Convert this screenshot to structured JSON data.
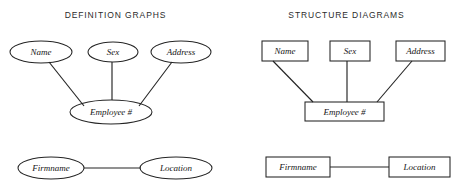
{
  "panels": [
    {
      "id": "definition-graphs",
      "title": "DEFINITION GRAPHS",
      "node_shape": "ellipse"
    },
    {
      "id": "structure-diagrams",
      "title": "STRUCTURE DIAGRAMS",
      "node_shape": "rectangle"
    }
  ],
  "diagram_left": {
    "nodes": [
      {
        "id": "name",
        "label": "Name",
        "cx": 41,
        "cy": 52,
        "rx": 31,
        "ry": 11
      },
      {
        "id": "sex",
        "label": "Sex",
        "cx": 113,
        "cy": 52,
        "rx": 25,
        "ry": 10
      },
      {
        "id": "address",
        "label": "Address",
        "cx": 181,
        "cy": 52,
        "rx": 30,
        "ry": 11
      },
      {
        "id": "employee",
        "label": "Employee #",
        "cx": 111,
        "cy": 112,
        "rx": 41,
        "ry": 12
      },
      {
        "id": "firmname",
        "label": "Firmname",
        "cx": 51,
        "cy": 168,
        "rx": 33,
        "ry": 11
      },
      {
        "id": "location",
        "label": "Location",
        "cx": 176,
        "cy": 168,
        "rx": 36,
        "ry": 11
      }
    ],
    "edges": [
      {
        "from": "name",
        "to": "employee",
        "x1": 49,
        "y1": 62,
        "x2": 84,
        "y2": 106
      },
      {
        "from": "sex",
        "to": "employee",
        "x1": 112,
        "y1": 62,
        "x2": 112,
        "y2": 100
      },
      {
        "from": "address",
        "to": "employee",
        "x1": 172,
        "y1": 62,
        "x2": 139,
        "y2": 106
      },
      {
        "from": "firmname",
        "to": "location",
        "x1": 84,
        "y1": 168,
        "x2": 141,
        "y2": 168
      }
    ]
  },
  "diagram_right": {
    "nodes": [
      {
        "id": "name",
        "label": "Name",
        "x": 262,
        "y": 41,
        "w": 46,
        "h": 20
      },
      {
        "id": "sex",
        "label": "Sex",
        "x": 330,
        "y": 41,
        "w": 40,
        "h": 20
      },
      {
        "id": "address",
        "label": "Address",
        "x": 396,
        "y": 41,
        "w": 49,
        "h": 20
      },
      {
        "id": "employee",
        "label": "Employee #",
        "x": 305,
        "y": 102,
        "w": 79,
        "h": 19
      },
      {
        "id": "firmname",
        "label": "Firmname",
        "x": 266,
        "y": 157,
        "w": 64,
        "h": 20
      },
      {
        "id": "location",
        "label": "Location",
        "x": 389,
        "y": 157,
        "w": 61,
        "h": 20
      }
    ],
    "edges": [
      {
        "from": "name",
        "to": "employee",
        "x1": 273,
        "y1": 61,
        "x2": 313,
        "y2": 102
      },
      {
        "from": "sex",
        "to": "employee",
        "x1": 347,
        "y1": 61,
        "x2": 347,
        "y2": 102
      },
      {
        "from": "address",
        "to": "employee",
        "x1": 412,
        "y1": 61,
        "x2": 377,
        "y2": 102
      },
      {
        "from": "firmname",
        "to": "location",
        "x1": 330,
        "y1": 167,
        "x2": 389,
        "y2": 167
      }
    ]
  },
  "colors": {
    "background": "#ffffff",
    "stroke": "#242424",
    "text": "#161616",
    "title": "#2b2b2b"
  }
}
